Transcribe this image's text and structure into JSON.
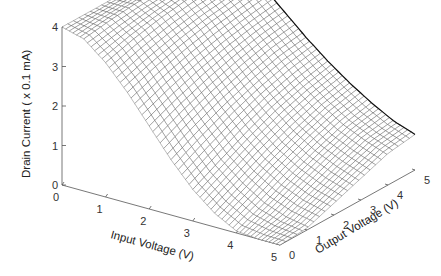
{
  "chart_data": {
    "type": "surface3d",
    "title": "",
    "xlabel": "Input Voltage  (V)",
    "ylabel": "Output Voltage  (V)",
    "zlabel": "Drain Current  ( x 0.1  mA)",
    "x_ticks": [
      "0",
      "1",
      "2",
      "3",
      "4",
      "5"
    ],
    "y_ticks": [
      "0",
      "1",
      "2",
      "3",
      "4",
      "5"
    ],
    "z_ticks": [
      "0",
      "1",
      "2",
      "3",
      "4"
    ],
    "xlim": [
      0,
      5
    ],
    "ylim": [
      0,
      5
    ],
    "zlim": [
      0,
      4
    ],
    "grid": false,
    "mesh": {
      "x_divisions": 60,
      "y_divisions": 24
    },
    "x": [
      0,
      0.5,
      1,
      1.5,
      2,
      2.5,
      3,
      3.5,
      4,
      4.5,
      5
    ],
    "y": [
      0,
      1,
      2,
      3,
      4,
      5
    ],
    "z_samples": [
      {
        "y": 0,
        "values": [
          4.0,
          3.85,
          3.4,
          2.8,
          2.1,
          1.4,
          0.8,
          0.35,
          0.05,
          0.0,
          0.0
        ]
      },
      {
        "y": 1,
        "values": [
          4.0,
          3.95,
          3.6,
          3.05,
          2.4,
          1.75,
          1.15,
          0.7,
          0.35,
          0.15,
          0.05
        ]
      },
      {
        "y": 2,
        "values": [
          4.0,
          4.02,
          3.75,
          3.25,
          2.65,
          2.05,
          1.5,
          1.05,
          0.7,
          0.45,
          0.3
        ]
      },
      {
        "y": 3,
        "values": [
          4.0,
          4.05,
          3.85,
          3.4,
          2.85,
          2.3,
          1.8,
          1.35,
          1.0,
          0.75,
          0.55
        ]
      },
      {
        "y": 4,
        "values": [
          4.0,
          4.08,
          3.9,
          3.5,
          3.0,
          2.5,
          2.0,
          1.6,
          1.25,
          1.0,
          0.8
        ]
      },
      {
        "y": 5,
        "values": [
          4.0,
          4.1,
          3.95,
          3.6,
          3.1,
          2.6,
          2.15,
          1.75,
          1.4,
          1.1,
          0.9
        ]
      }
    ],
    "colors": {
      "surface_fill": "#ffffff",
      "mesh": "#3a3a3a",
      "axis": "#555555"
    }
  }
}
